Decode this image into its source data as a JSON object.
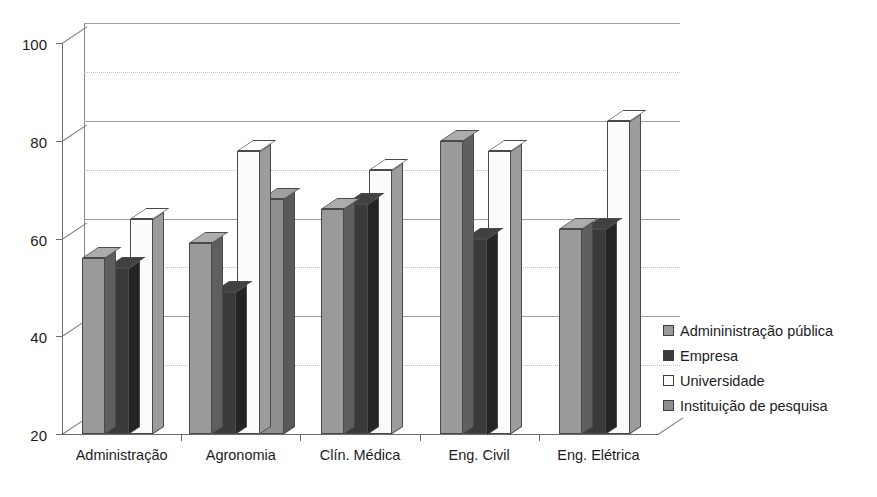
{
  "chart_data": {
    "type": "bar",
    "title": "",
    "subtitle": "",
    "xlabel": "",
    "ylabel": "",
    "ylim": [
      20,
      100
    ],
    "yticks": [
      20,
      40,
      60,
      80,
      100
    ],
    "yticklabels": [
      "20",
      "40",
      "60",
      "80",
      "100"
    ],
    "minor_gridlines": [
      30,
      50,
      70,
      90
    ],
    "grid": true,
    "style": "3d-grayscale",
    "legend_position": "right",
    "categories": [
      "Administração",
      "Agronomia",
      "Clín. Médica",
      "Eng. Civil",
      "Eng. Elétrica"
    ],
    "series": [
      {
        "name": "Admininistração pública",
        "color": "#9a9a9a",
        "values": [
          56,
          59,
          66,
          80,
          62
        ]
      },
      {
        "name": "Empresa",
        "color": "#3a3a3a",
        "values": [
          54,
          49,
          67,
          60,
          62
        ]
      },
      {
        "name": "Universidade",
        "color": "#fbfbfb",
        "values": [
          64,
          78,
          74,
          78,
          84
        ]
      },
      {
        "name": "Instituição de pesquisa",
        "color": "#8f8f8f",
        "values": [
          null,
          68,
          null,
          null,
          null
        ]
      }
    ]
  },
  "legend": {
    "items": [
      {
        "label": "Admininistração pública",
        "color": "#9a9a9a"
      },
      {
        "label": "Empresa",
        "color": "#3a3a3a"
      },
      {
        "label": "Universidade",
        "color": "#fbfbfb"
      },
      {
        "label": "Instituição de pesquisa",
        "color": "#8f8f8f"
      }
    ]
  }
}
